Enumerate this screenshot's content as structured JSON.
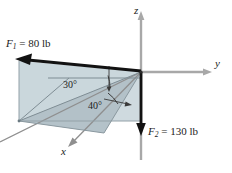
{
  "figure": {
    "axes": {
      "z_label": "z",
      "y_label": "y",
      "x_label": "x"
    },
    "forces": [
      {
        "id": "F1",
        "symbol": "F",
        "subscript": "1",
        "magnitude": "80",
        "unit": "lb",
        "label": "F₁ = 80 lb",
        "direction": "up-left along plane"
      },
      {
        "id": "F2",
        "symbol": "F",
        "subscript": "2",
        "magnitude": "130",
        "unit": "lb",
        "label": "F₂ = 130 lb",
        "direction": "down along negative z"
      }
    ],
    "angles": [
      {
        "id": "angle-30",
        "value": "30",
        "label": "30°"
      },
      {
        "id": "angle-40",
        "value": "40",
        "label": "40°"
      }
    ],
    "colors": {
      "plane_fill_light": "#ccd8dd",
      "plane_fill_mid": "#bfcdd4",
      "plane_fill_dark": "#aebcc4",
      "axis_gray": "#a8a8a8",
      "vector_black": "#121212",
      "thin_line": "#8b99a0",
      "text": "#1b1b1b"
    }
  }
}
